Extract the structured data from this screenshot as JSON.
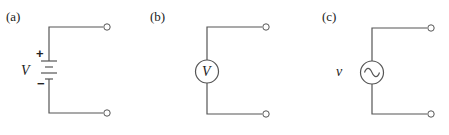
{
  "diagram": {
    "type": "circuit-source-symbols",
    "panels": [
      {
        "label": "(a)",
        "source_type": "battery (DC voltage source)",
        "symbol": "V",
        "plus_sign": "+",
        "minus_sign": "−",
        "terminals": 2
      },
      {
        "label": "(b)",
        "source_type": "DC voltage source (circle)",
        "symbol": "V",
        "terminals": 2
      },
      {
        "label": "(c)",
        "source_type": "AC voltage source (sine in circle)",
        "symbol": "v",
        "terminals": 2
      }
    ]
  }
}
